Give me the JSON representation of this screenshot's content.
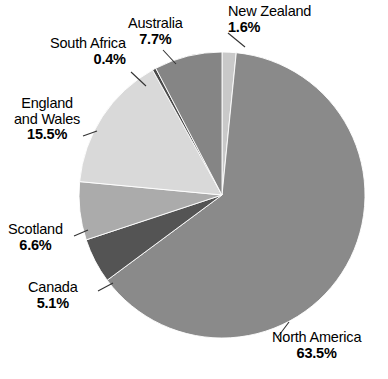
{
  "chart_data": {
    "type": "pie",
    "title": "",
    "subtitle": "",
    "xlabel": "",
    "ylabel": "",
    "legend_position": "none",
    "grid": false,
    "units": "percent",
    "start_angle_deg": 0,
    "direction": "clockwise",
    "categories": [
      "New Zealand",
      "North America",
      "Canada",
      "Scotland",
      "England and Wales",
      "South Africa",
      "Australia"
    ],
    "values": [
      1.6,
      63.5,
      5.1,
      6.6,
      15.5,
      0.4,
      7.7
    ],
    "slices": [
      {
        "name": "New Zealand",
        "label_line1": "New Zealand",
        "label_line2": "",
        "value": 1.6,
        "value_label": "1.6%",
        "color": "#c9c9c9"
      },
      {
        "name": "North America",
        "label_line1": "North America",
        "label_line2": "",
        "value": 63.5,
        "value_label": "63.5%",
        "color": "#8a8a8a"
      },
      {
        "name": "Canada",
        "label_line1": "Canada",
        "label_line2": "",
        "value": 5.1,
        "value_label": "5.1%",
        "color": "#545454"
      },
      {
        "name": "Scotland",
        "label_line1": "Scotland",
        "label_line2": "",
        "value": 6.6,
        "value_label": "6.6%",
        "color": "#ababab"
      },
      {
        "name": "England and Wales",
        "label_line1": "England",
        "label_line2": "and Wales",
        "value": 15.5,
        "value_label": "15.5%",
        "color": "#d9d9d9"
      },
      {
        "name": "South Africa",
        "label_line1": "South Africa",
        "label_line2": "",
        "value": 0.4,
        "value_label": "0.4%",
        "color": "#4a4a4a"
      },
      {
        "name": "Australia",
        "label_line1": "Australia",
        "label_line2": "",
        "value": 7.7,
        "value_label": "7.7%",
        "color": "#858585"
      }
    ]
  },
  "labels": {
    "new_zealand": {
      "line1": "New Zealand",
      "line2": "",
      "pct": "1.6%"
    },
    "australia": {
      "line1": "Australia",
      "line2": "",
      "pct": "7.7%"
    },
    "south_africa": {
      "line1": "South Africa",
      "line2": "",
      "pct": "0.4%"
    },
    "england_wales": {
      "line1": "England",
      "line2": "and Wales",
      "pct": "15.5%"
    },
    "scotland": {
      "line1": "Scotland",
      "line2": "",
      "pct": "6.6%"
    },
    "canada": {
      "line1": "Canada",
      "line2": "",
      "pct": "5.1%"
    },
    "north_america": {
      "line1": "North America",
      "line2": "",
      "pct": "63.5%"
    }
  },
  "geometry": {
    "center_x": 222,
    "center_y": 195,
    "radius": 143
  },
  "colors": {
    "background": "#ffffff",
    "text": "#000000",
    "leader_line": "#333333"
  }
}
